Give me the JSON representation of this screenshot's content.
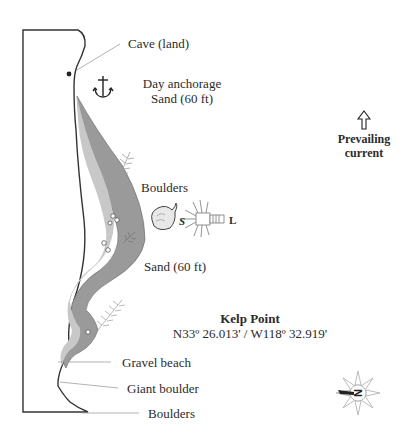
{
  "map": {
    "labels": {
      "cave": "Cave (land)",
      "anchorage_line1": "Day anchorage",
      "anchorage_line2": "Sand (60 ft)",
      "boulders_upper": "Boulders",
      "sand_lower": "Sand (60 ft)",
      "site_name": "Kelp Point",
      "coordinates": "N33º 26.013' / W118º 32.919'",
      "gravel_beach": "Gravel beach",
      "giant_boulder": "Giant boulder",
      "boulders_lower": "Boulders",
      "current_line1": "Prevailing",
      "current_line2": "current"
    },
    "marine_life": [
      {
        "icon": "scallop-icon",
        "code": "S"
      },
      {
        "icon": "lobster-icon",
        "code": "L"
      }
    ],
    "icons": {
      "anchor": "anchor-icon",
      "current_arrow": "up-arrow-icon",
      "compass": "compass-rose-icon",
      "compass_letter": "N"
    },
    "colors": {
      "reef_light": "#c4c4c4",
      "reef_dark": "#9a9a9a",
      "line": "#333333",
      "leader": "#9a9a9a"
    }
  }
}
